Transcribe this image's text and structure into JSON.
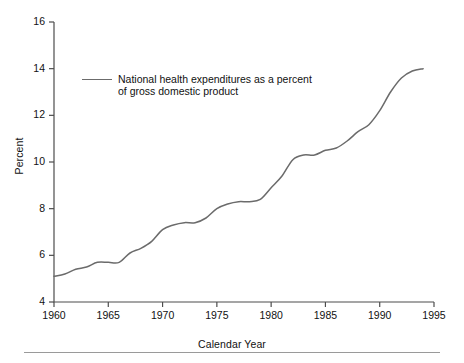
{
  "chart_data": {
    "type": "line",
    "title": "",
    "xlabel": "Calendar Year",
    "ylabel": "Percent",
    "xlim": [
      1960,
      1995
    ],
    "ylim": [
      4,
      16
    ],
    "xticks": [
      1960,
      1965,
      1970,
      1975,
      1980,
      1985,
      1990,
      1995
    ],
    "yticks": [
      4,
      6,
      8,
      10,
      12,
      14,
      16
    ],
    "grid": false,
    "legend_position": "upper-left-inside",
    "series": [
      {
        "name": "National health expenditures as a percent\nof gross domestic product",
        "color": "#6b6b6b",
        "x": [
          1960,
          1961,
          1962,
          1963,
          1964,
          1965,
          1966,
          1967,
          1968,
          1969,
          1970,
          1971,
          1972,
          1973,
          1974,
          1975,
          1976,
          1977,
          1978,
          1979,
          1980,
          1981,
          1982,
          1983,
          1984,
          1985,
          1986,
          1987,
          1988,
          1989,
          1990,
          1991,
          1992,
          1993,
          1994
        ],
        "values": [
          5.1,
          5.2,
          5.4,
          5.5,
          5.7,
          5.7,
          5.7,
          6.1,
          6.3,
          6.6,
          7.1,
          7.3,
          7.4,
          7.4,
          7.6,
          8.0,
          8.2,
          8.3,
          8.3,
          8.4,
          8.9,
          9.4,
          10.1,
          10.3,
          10.3,
          10.5,
          10.6,
          10.9,
          11.3,
          11.6,
          12.2,
          13.0,
          13.6,
          13.9,
          14.0
        ]
      }
    ]
  },
  "axes": {
    "y_tick_labels": [
      "16",
      "14",
      "12",
      "10",
      "8",
      "6",
      "4"
    ],
    "x_tick_labels": [
      "1960",
      "1965",
      "1970",
      "1975",
      "1980",
      "1985",
      "1990",
      "1995"
    ],
    "y_axis_title": "Percent",
    "x_axis_title": "Calendar Year"
  },
  "legend": {
    "line1": "National health expenditures as a percent",
    "line2": "of gross domestic product",
    "swatch_color": "#6b6b6b"
  },
  "style": {
    "background": "#ffffff",
    "axis_color": "#4d4d4d",
    "text_color": "#111111",
    "rule_color": "#9a9a9a"
  }
}
